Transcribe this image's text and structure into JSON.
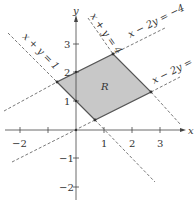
{
  "figure": {
    "region_label": "R",
    "region_fill": "#c8c8c8",
    "region_stroke": "#555555",
    "axis_color": "#444444",
    "dash_color": "#555555",
    "axes": {
      "x_label": "x",
      "y_label": "y",
      "x_ticks": [
        "−2",
        "1",
        "2",
        "3"
      ],
      "y_ticks": [
        "3",
        "2",
        "1",
        "−1",
        "−2"
      ]
    },
    "lines": [
      {
        "label": "x + y = 1"
      },
      {
        "label": "x + y = 4"
      },
      {
        "label": "x − 2y = −4"
      },
      {
        "label": "x − 2y = 0"
      }
    ],
    "vertices": [
      {
        "name": "left",
        "x": "-2/3",
        "y": "5/3"
      },
      {
        "name": "bottom",
        "x": "2/3",
        "y": "1/3"
      },
      {
        "name": "top",
        "x": "4/3",
        "y": "8/3"
      },
      {
        "name": "right",
        "x": "8/3",
        "y": "4/3"
      }
    ]
  }
}
